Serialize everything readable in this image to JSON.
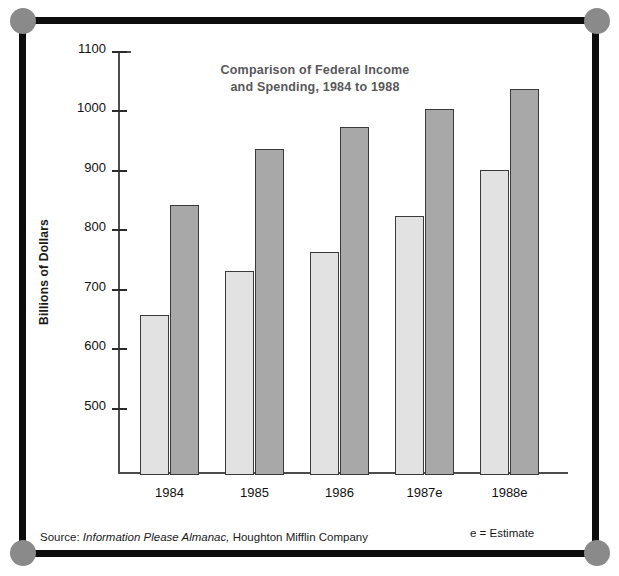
{
  "chart_data": {
    "type": "bar",
    "title": "Comparison of Federal Income and Spending, 1984 to 1988",
    "title_line1": "Comparison of Federal Income",
    "title_line2": "and Spending, 1984 to 1988",
    "xlabel": "",
    "ylabel": "Billions of Dollars",
    "ylim": [
      390,
      1100
    ],
    "ytick_labels": [
      "1100",
      "1000",
      "900",
      "800",
      "700",
      "600",
      "500"
    ],
    "yticks": [
      1100,
      1000,
      900,
      800,
      700,
      600,
      500
    ],
    "grid": false,
    "legend": "none",
    "categories": [
      "1984",
      "1985",
      "1986",
      "1987e",
      "1988e"
    ],
    "series": [
      {
        "name": "Income",
        "color": "#e2e2e2",
        "values": [
          660,
          733,
          766,
          826,
          903
        ]
      },
      {
        "name": "Spending",
        "color": "#a8a8a8",
        "values": [
          845,
          938,
          975,
          1005,
          1040
        ]
      }
    ]
  },
  "footer": {
    "source_prefix": "Source:",
    "source_italic": "Information Please Almanac,",
    "source_suffix": "Houghton Mifflin Company",
    "estimate_note": "e = Estimate"
  },
  "frame": {
    "line_color": "#0d0d0d",
    "dot_color": "#8a8a8a"
  }
}
